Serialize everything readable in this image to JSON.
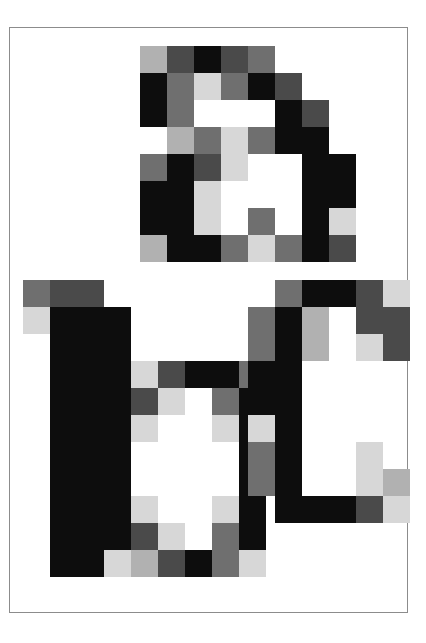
{
  "canvas": {
    "width": 426,
    "height": 643,
    "background": "#ffffff"
  },
  "frame": {
    "label": "artwork frame",
    "x": 9,
    "y": 27,
    "width": 399,
    "height": 586,
    "border_color": "#8c8c8c",
    "border_width": 1,
    "fill": "#ffffff"
  },
  "palette": {
    "black": "#0d0d0d",
    "dark_gray": "#4a4a4a",
    "mid_gray": "#6f6f6f",
    "light_gray": "#b1b1b1",
    "pale_gray": "#d7d7d7",
    "white": "#ffffff"
  },
  "tone_legend": {
    "K": "black",
    "D": "dark_gray",
    "M": "mid_gray",
    "L": "light_gray",
    "P": "pale_gray",
    ".": "white"
  },
  "grid": {
    "cell_size": 27,
    "note": "each glyph is a mosaic of 27x27 px square tiles"
  },
  "glyphs": [
    {
      "name": "letter-a",
      "character": "a",
      "origin_x": 139,
      "origin_y": 45,
      "cols": 8,
      "rows": 8,
      "rows_data": [
        "LDKDM...",
        "KMPMKD..",
        "KM...KD.",
        ".LMPMKK.",
        "MKDP..KK",
        "KKP...KK",
        "KKP.M.KP",
        "LKKMPMKD"
      ]
    },
    {
      "name": "letter-b",
      "character": "b",
      "origin_x": 22,
      "origin_y": 279,
      "cols": 9,
      "rows": 11,
      "rows_data": [
        "MDD......",
        "PKKK.....",
        ".KKK.....",
        ".KKKPDKKM",
        ".KKKDP.MK",
        ".KKKP..PK",
        ".KKK....K",
        ".KKK....K",
        ".KKKP..PK",
        ".KKKDP.MK",
        ".KKPLDKMP"
      ]
    },
    {
      "name": "letter-c",
      "character": "c",
      "origin_x": 247,
      "origin_y": 279,
      "cols": 6,
      "rows": 9,
      "rows_data": [
        ".MKKDP",
        "MKL.DD",
        "MKL.PD",
        "KK....",
        "KK....",
        "PK....",
        "MK..P.",
        "MK..PL",
        ".KKKDP"
      ]
    }
  ],
  "overlaps": {
    "note": "glyph b and glyph c bounding boxes overlap near x=247..265; c is drawn above b"
  }
}
